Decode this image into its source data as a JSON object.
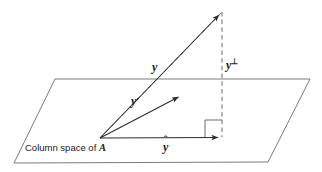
{
  "figure": {
    "width": 322,
    "height": 172,
    "background_color": "#ffffff",
    "stroke_color": "#3a3a3a",
    "text_color": "#1a1a1a"
  },
  "plane": {
    "name": "column-space-plane",
    "label_text": "Column space of ",
    "matrix_symbol": "A",
    "corners": [
      {
        "x": 55,
        "y": 79
      },
      {
        "x": 310,
        "y": 79
      },
      {
        "x": 268,
        "y": 162
      },
      {
        "x": 14,
        "y": 163
      }
    ]
  },
  "vectors": [
    {
      "id": "y",
      "label": "y",
      "description": "vector y from origin to apex",
      "from": {
        "x": 100,
        "y": 138
      },
      "to": {
        "x": 222,
        "y": 12
      },
      "style": "solid",
      "arrow": true
    },
    {
      "id": "y-prime",
      "label": "y",
      "prime": "'",
      "description": "vector y prime, a point in the column space",
      "from": {
        "x": 100,
        "y": 138
      },
      "to": {
        "x": 182,
        "y": 95
      },
      "style": "solid",
      "arrow": true
    },
    {
      "id": "y-hat",
      "label": "y",
      "hat": "^",
      "description": "orthogonal projection y-hat of y onto the plane",
      "from": {
        "x": 100,
        "y": 138
      },
      "to": {
        "x": 222,
        "y": 137
      },
      "style": "solid",
      "arrow": true
    },
    {
      "id": "y-perp",
      "label": "y",
      "perp": "⊥",
      "description": "residual component y perpendicular, dashed vertical segment",
      "from": {
        "x": 222,
        "y": 12
      },
      "to": {
        "x": 222,
        "y": 137
      },
      "style": "dashed",
      "arrow": false
    },
    {
      "id": "y-prime-extension",
      "label": "",
      "description": "dashed guide line from origin through y prime to the apex",
      "from": {
        "x": 100,
        "y": 138
      },
      "to": {
        "x": 222,
        "y": 12
      },
      "style": "dashed",
      "arrow": false
    }
  ],
  "right_angle_marker": {
    "name": "right-angle-marker",
    "vertex": {
      "x": 222,
      "y": 137
    },
    "size": 17
  },
  "labels": {
    "y": "y",
    "y_prime_base": "y",
    "y_prime_mark": "′",
    "y_perp_base": "y",
    "y_perp_mark": "⊥",
    "y_hat_base": "y",
    "y_hat_mark": "ˆ",
    "plane_text": "Column space of ",
    "plane_matrix": "A"
  }
}
